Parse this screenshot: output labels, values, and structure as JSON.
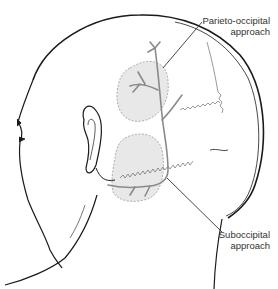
{
  "figure": {
    "type": "anatomical-illustration",
    "colors": {
      "outline": "#1a1a1a",
      "vessel": "#8a8a8a",
      "region_fill": "#e6e6e6",
      "region_border": "#9a9a9a",
      "label_text": "#333333"
    }
  },
  "labels": {
    "parieto_occipital": {
      "line1": "Parieto-occipital",
      "line2": "approach"
    },
    "suboccipital": {
      "line1": "Suboccipital",
      "line2": "approach"
    }
  }
}
